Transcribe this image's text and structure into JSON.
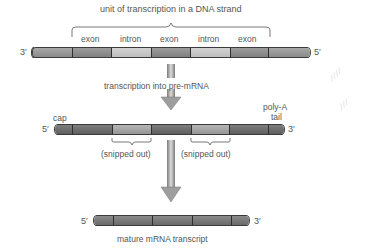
{
  "diagram": {
    "title": "unit of transcription in a DNA strand",
    "dna_strand": {
      "left_end": "3′",
      "right_end": "5′",
      "segment_labels": [
        "exon",
        "intron",
        "exon",
        "intron",
        "exon"
      ]
    },
    "step1_label": "transcription into pre-mRNA",
    "pre_mrna": {
      "left_end": "5′",
      "right_end": "3′",
      "cap_label": "cap",
      "tail_label_line1": "poly-A",
      "tail_label_line2": "tail",
      "snipped_label_1": "(snipped out)",
      "snipped_label_2": "(snipped out)"
    },
    "mature_mrna": {
      "left_end": "5′",
      "right_end": "3′",
      "caption": "mature mRNA transcript"
    },
    "colors": {
      "exon": "#8c8c8c",
      "intron": "#c4c4c4",
      "dna_flank": "#9a9a9a",
      "pre_exon": "#6e6e6e",
      "pre_intron": "#a8a8a8",
      "mature": "#777777",
      "arrow": "#9e9e9e"
    }
  }
}
